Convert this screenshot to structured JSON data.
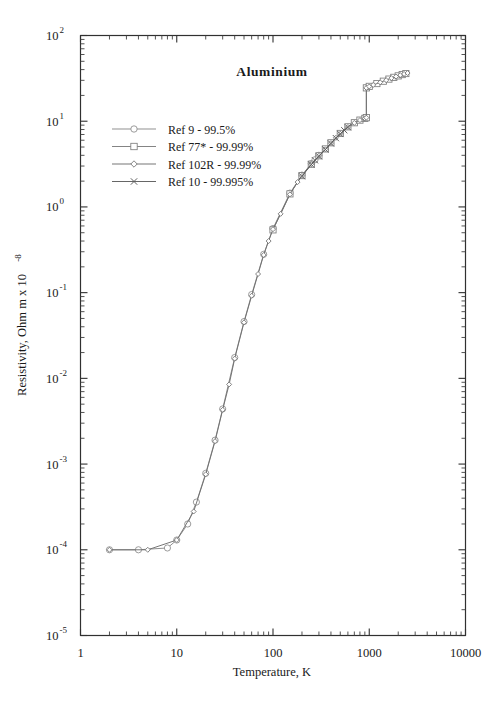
{
  "chart_data": {
    "type": "line",
    "title": "Aluminium",
    "xlabel": "Temperature,  K",
    "ylabel_html": "Resistivity, Ohm m x 10",
    "ylabel_exponent": "-8",
    "xscale": "log",
    "yscale": "log",
    "xlim": [
      1,
      10000
    ],
    "ylim": [
      1e-05,
      100
    ],
    "grid": false,
    "legend_position": "upper-left-inside",
    "xticks": [
      "1",
      "10",
      "100",
      "1000",
      "10000"
    ],
    "xtick_values": [
      1,
      10,
      100,
      1000,
      10000
    ],
    "yticks": [
      "10",
      "10",
      "10",
      "10",
      "10",
      "10",
      "10",
      "10"
    ],
    "ytick_exponents": [
      "2",
      "1",
      "0",
      "-1",
      "-2",
      "-3",
      "-4",
      "-5"
    ],
    "ytick_values": [
      100,
      10,
      1,
      0.1,
      0.01,
      0.001,
      0.0001,
      1e-05
    ],
    "annotations": [
      "Residual resistivity plateau near 1e-4 below about 10 K",
      "Vertical jump at the melting point near 933 K from about 10 to about 25"
    ],
    "series": [
      {
        "name": "Ref 9 - 99.5%",
        "marker": "circle",
        "color": "#8a8a8a",
        "points": [
          [
            2,
            0.0001
          ],
          [
            4,
            0.0001
          ],
          [
            8,
            0.000105
          ],
          [
            10,
            0.00013
          ],
          [
            13,
            0.0002
          ],
          [
            16,
            0.00036
          ],
          [
            20,
            0.00078
          ],
          [
            25,
            0.0019
          ],
          [
            30,
            0.0044
          ],
          [
            40,
            0.0175
          ],
          [
            50,
            0.046
          ],
          [
            60,
            0.095
          ],
          [
            80,
            0.28
          ],
          [
            100,
            0.56
          ],
          [
            150,
            1.45
          ],
          [
            200,
            2.35
          ],
          [
            250,
            3.2
          ],
          [
            273,
            3.55
          ],
          [
            300,
            4.0
          ]
        ]
      },
      {
        "name": "Ref 77* - 99.99%",
        "marker": "square",
        "color": "#7d7d7d",
        "points": [
          [
            100,
            0.54
          ],
          [
            150,
            1.42
          ],
          [
            200,
            2.32
          ],
          [
            250,
            3.15
          ],
          [
            300,
            3.95
          ],
          [
            350,
            4.75
          ],
          [
            400,
            5.6
          ],
          [
            500,
            7.2
          ],
          [
            600,
            8.6
          ],
          [
            700,
            9.6
          ],
          [
            800,
            10.3
          ],
          [
            900,
            10.8
          ],
          [
            933,
            11.0
          ],
          [
            933,
            24.5
          ],
          [
            1000,
            25.5
          ],
          [
            1200,
            27.5
          ],
          [
            1400,
            29.3
          ],
          [
            1600,
            31.0
          ],
          [
            1800,
            32.5
          ],
          [
            2000,
            33.8
          ],
          [
            2200,
            35.0
          ],
          [
            2400,
            36.0
          ]
        ]
      },
      {
        "name": "Ref 102R - 99.99%",
        "marker": "diamond",
        "color": "#6f6f6f",
        "points": [
          [
            2,
            0.0001
          ],
          [
            5,
            0.0001
          ],
          [
            10,
            0.00013
          ],
          [
            15,
            0.00028
          ],
          [
            20,
            0.00076
          ],
          [
            25,
            0.00185
          ],
          [
            30,
            0.0043
          ],
          [
            35,
            0.0085
          ],
          [
            40,
            0.017
          ],
          [
            50,
            0.045
          ],
          [
            60,
            0.092
          ],
          [
            70,
            0.165
          ],
          [
            80,
            0.275
          ],
          [
            90,
            0.4
          ],
          [
            100,
            0.55
          ],
          [
            120,
            0.83
          ],
          [
            150,
            1.4
          ],
          [
            180,
            1.95
          ],
          [
            200,
            2.3
          ],
          [
            250,
            3.15
          ],
          [
            300,
            3.95
          ],
          [
            350,
            4.7
          ],
          [
            400,
            5.55
          ],
          [
            450,
            6.4
          ],
          [
            500,
            7.15
          ],
          [
            600,
            8.55
          ],
          [
            700,
            9.55
          ],
          [
            800,
            10.3
          ],
          [
            900,
            10.8
          ],
          [
            933,
            11.0
          ],
          [
            933,
            24.5
          ],
          [
            1000,
            25.4
          ],
          [
            1100,
            26.5
          ],
          [
            1300,
            28.4
          ],
          [
            1500,
            30.1
          ],
          [
            1700,
            31.8
          ],
          [
            1900,
            33.2
          ],
          [
            2100,
            34.5
          ],
          [
            2300,
            35.6
          ],
          [
            2500,
            36.5
          ]
        ]
      },
      {
        "name": "Ref 10 - 99.995%",
        "marker": "cross",
        "color": "#5e5e5e",
        "points": [
          [
            200,
            2.28
          ],
          [
            250,
            3.12
          ],
          [
            273,
            3.5
          ],
          [
            300,
            3.9
          ],
          [
            350,
            4.68
          ],
          [
            400,
            5.5
          ],
          [
            450,
            6.35
          ],
          [
            500,
            7.1
          ],
          [
            550,
            7.85
          ],
          [
            600,
            8.5
          ]
        ]
      }
    ]
  },
  "legend": {
    "items": [
      {
        "label": "Ref 9 - 99.5%"
      },
      {
        "label": "Ref 77* - 99.99%"
      },
      {
        "label": "Ref 102R - 99.99%"
      },
      {
        "label": "Ref 10 - 99.995%"
      }
    ]
  }
}
